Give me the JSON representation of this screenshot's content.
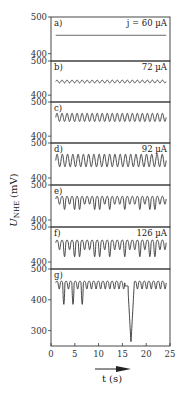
{
  "chart_data": {
    "type": "line",
    "title": "",
    "xlabel": "t (s)",
    "ylabel": "U_NHE (mV)",
    "xlim": [
      0,
      25
    ],
    "x_ticks": [
      "0",
      "5",
      "10",
      "15",
      "20",
      "25"
    ],
    "grid": false,
    "panels": [
      {
        "label": "a)",
        "current": "j = 60 µA",
        "ylim": [
          380,
          500
        ],
        "y_ticks": [
          "500",
          "400"
        ],
        "waveform": "flat",
        "mean": 450,
        "amplitude": 0,
        "cycles": 0
      },
      {
        "label": "b)",
        "current": "72 µA",
        "ylim": [
          380,
          500
        ],
        "y_ticks": [
          "500",
          "400"
        ],
        "waveform": "small-sine",
        "mean": 440,
        "amplitude": 4,
        "cycles": 22
      },
      {
        "label": "c)",
        "current": "",
        "ylim": [
          380,
          500
        ],
        "y_ticks": [
          "500",
          "400"
        ],
        "waveform": "sine",
        "mean": 455,
        "amplitude": 12,
        "cycles": 22
      },
      {
        "label": "d)",
        "current": "92 µA",
        "ylim": [
          380,
          500
        ],
        "y_ticks": [
          "500",
          "400"
        ],
        "waveform": "sine",
        "mean": 450,
        "amplitude": 18,
        "cycles": 21
      },
      {
        "label": "e)",
        "current": "",
        "ylim": [
          380,
          500
        ],
        "y_ticks": [
          "500",
          "400"
        ],
        "waveform": "mixed-mode",
        "mean": 450,
        "amplitude": 30,
        "cycles": 22
      },
      {
        "label": "f)",
        "current": "126 µA",
        "ylim": [
          380,
          500
        ],
        "y_ticks": [
          "500",
          "400"
        ],
        "waveform": "mixed-mode",
        "mean": 445,
        "amplitude": 40,
        "cycles": 22
      },
      {
        "label": "g)",
        "current": "",
        "ylim": [
          250,
          500
        ],
        "y_ticks": [
          "500",
          "400",
          "300"
        ],
        "waveform": "bursting-with-spike",
        "mean": 440,
        "amplitude": 25,
        "spike_min": 260,
        "spike_t": 16.8,
        "cycles": 24
      }
    ]
  },
  "labels": {
    "y_axis": "U",
    "y_axis_sub": "NHE",
    "y_axis_unit": "(mV)",
    "x_axis": "t (s)"
  }
}
